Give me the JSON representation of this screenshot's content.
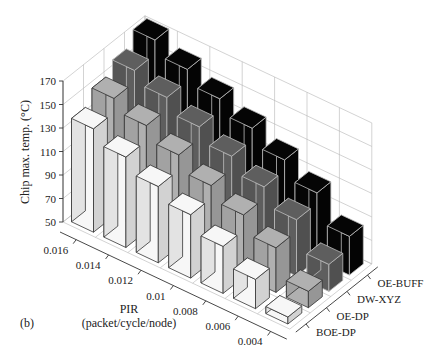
{
  "panel_label": "(b)",
  "chart_data": {
    "type": "bar3d",
    "title": "",
    "zlabel": "Chip max. temp. (°C)",
    "xlabel_line1": "PIR",
    "xlabel_line2": "(packet/cycle/node)",
    "zlim": [
      50,
      170
    ],
    "z_ticks": [
      50,
      70,
      90,
      110,
      130,
      150,
      170
    ],
    "grid": true,
    "categories": [
      "0.016",
      "0.014",
      "0.012",
      "0.01",
      "0.008",
      "0.006",
      "0.004"
    ],
    "series": [
      {
        "name": "BOE-DP",
        "color": "#f7f7f7",
        "values": [
          138,
          127,
          115,
          104,
          90,
          75,
          56
        ]
      },
      {
        "name": "OE-DP",
        "color": "#b0b0b0",
        "values": [
          150,
          140,
          128,
          115,
          103,
          88,
          64
        ]
      },
      {
        "name": "DW-XYZ",
        "color": "#5e5e5e",
        "values": [
          160,
          150,
          138,
          126,
          113,
          98,
          73
        ]
      },
      {
        "name": "OE-BUFF",
        "color": "#050505",
        "values": [
          172,
          160,
          148,
          136,
          122,
          107,
          83
        ]
      }
    ]
  }
}
